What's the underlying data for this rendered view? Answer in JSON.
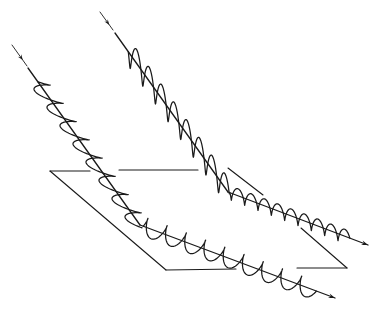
{
  "diagram": {
    "colors": {
      "ink": "#1a1a1a",
      "background": "#ffffff"
    },
    "plane": {
      "corners": [
        [
          50,
          171
        ],
        [
          228,
          169
        ],
        [
          347,
          268
        ],
        [
          166,
          270
        ]
      ],
      "segments": [
        [
          [
            50,
            171
          ],
          [
            90,
            171
          ]
        ],
        [
          [
            119,
            170
          ],
          [
            198,
            170
          ]
        ],
        [
          [
            228,
            168
          ],
          [
            263,
            195
          ]
        ],
        [
          [
            301,
            228
          ],
          [
            347,
            268
          ]
        ],
        [
          [
            347,
            268
          ],
          [
            297,
            268
          ]
        ],
        [
          [
            236,
            269
          ],
          [
            166,
            270
          ]
        ],
        [
          [
            166,
            270
          ],
          [
            50,
            171
          ]
        ]
      ]
    },
    "beams": [
      {
        "name": "beam-horizontal-polarization",
        "incident_lead": [
          [
            12,
            45
          ],
          [
            27,
            66
          ]
        ],
        "incident": [
          [
            28,
            68
          ],
          [
            140,
            225
          ]
        ],
        "reflected": [
          [
            140,
            225
          ],
          [
            335,
            298
          ]
        ],
        "incident_wave": {
          "cycles": 8,
          "amplitude": 11,
          "orientation": "horizontal"
        },
        "reflected_wave": {
          "cycles": 9,
          "amplitude": 9,
          "orientation": "perpendicular-loop"
        }
      },
      {
        "name": "beam-vertical-polarization",
        "incident_lead": [
          [
            100,
            12
          ],
          [
            113,
            30
          ]
        ],
        "incident": [
          [
            115,
            33
          ],
          [
            228,
            192
          ]
        ],
        "reflected": [
          [
            228,
            192
          ],
          [
            368,
            245
          ]
        ],
        "incident_wave": {
          "cycles": 8,
          "amplitude": 14,
          "orientation": "vertical"
        },
        "reflected_wave": {
          "cycles": 9,
          "amplitude": 7,
          "orientation": "vertical"
        }
      }
    ]
  }
}
